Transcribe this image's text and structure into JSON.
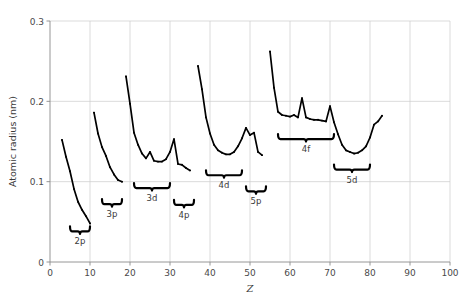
{
  "chart_data": {
    "type": "line",
    "title": "",
    "xlabel": "Z",
    "ylabel": "Atomic radius (nm)",
    "xlim": [
      0,
      100
    ],
    "ylim": [
      0,
      0.3
    ],
    "xticks": [
      0,
      10,
      20,
      30,
      40,
      50,
      60,
      70,
      80,
      90,
      100
    ],
    "xtick_labels": [
      "0",
      "10",
      "20",
      "30",
      "40",
      "50",
      "60",
      "70",
      "80",
      "90",
      "100"
    ],
    "yticks": [
      0,
      0.1,
      0.2,
      0.3
    ],
    "ytick_labels": [
      "0",
      "0.1",
      "0.2",
      "0.3"
    ],
    "grid": true,
    "grid_color": "#cccccc",
    "line_color": "#000000",
    "series": [
      {
        "name": "period-2",
        "x": [
          3,
          4,
          5,
          6,
          7,
          8,
          9,
          10
        ],
        "y": [
          0.152,
          0.131,
          0.113,
          0.091,
          0.075,
          0.065,
          0.057,
          0.048
        ]
      },
      {
        "name": "period-3",
        "x": [
          11,
          12,
          13,
          14,
          15,
          16,
          17,
          18
        ],
        "y": [
          0.186,
          0.16,
          0.143,
          0.132,
          0.118,
          0.109,
          0.102,
          0.1
        ]
      },
      {
        "name": "period-4",
        "x": [
          19,
          20,
          21,
          22,
          23,
          24,
          25,
          26,
          27,
          28,
          29,
          30,
          31,
          32,
          33,
          34,
          35
        ],
        "y": [
          0.231,
          0.197,
          0.161,
          0.146,
          0.135,
          0.129,
          0.137,
          0.126,
          0.125,
          0.125,
          0.128,
          0.137,
          0.153,
          0.122,
          0.121,
          0.117,
          0.114
        ]
      },
      {
        "name": "period-5",
        "x": [
          37,
          38,
          39,
          40,
          41,
          42,
          43,
          44,
          45,
          46,
          47,
          48,
          49,
          50,
          51,
          52,
          53
        ],
        "y": [
          0.244,
          0.215,
          0.18,
          0.16,
          0.146,
          0.139,
          0.136,
          0.134,
          0.134,
          0.137,
          0.144,
          0.154,
          0.167,
          0.158,
          0.161,
          0.137,
          0.133
        ]
      },
      {
        "name": "period-6",
        "x": [
          55,
          56,
          57,
          58,
          59,
          60,
          61,
          62,
          63,
          64,
          65,
          66,
          67,
          68,
          69,
          70,
          71,
          72,
          73,
          74,
          75,
          76,
          77,
          78,
          79,
          80,
          81,
          82,
          83
        ],
        "y": [
          0.262,
          0.217,
          0.187,
          0.183,
          0.182,
          0.181,
          0.183,
          0.18,
          0.204,
          0.18,
          0.178,
          0.177,
          0.177,
          0.176,
          0.175,
          0.194,
          0.174,
          0.159,
          0.146,
          0.139,
          0.137,
          0.135,
          0.136,
          0.139,
          0.144,
          0.155,
          0.171,
          0.175,
          0.182
        ]
      }
    ],
    "braces": [
      {
        "label": "2p",
        "x_start": 5,
        "x_end": 10,
        "y": 0.038
      },
      {
        "label": "3p",
        "x_start": 13,
        "x_end": 18,
        "y": 0.072
      },
      {
        "label": "3d",
        "x_start": 21,
        "x_end": 30,
        "y": 0.092
      },
      {
        "label": "4p",
        "x_start": 31,
        "x_end": 36,
        "y": 0.071
      },
      {
        "label": "4d",
        "x_start": 39,
        "x_end": 48,
        "y": 0.108
      },
      {
        "label": "5p",
        "x_start": 49,
        "x_end": 54,
        "y": 0.088
      },
      {
        "label": "4f",
        "x_start": 57,
        "x_end": 71,
        "y": 0.153
      },
      {
        "label": "5d",
        "x_start": 71,
        "x_end": 80,
        "y": 0.115
      }
    ]
  }
}
